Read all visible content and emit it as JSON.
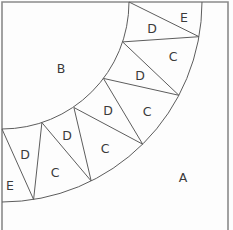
{
  "figure": {
    "figure_type": "quarter-ring-triangulated-template",
    "canvas": {
      "width": 233,
      "height": 230
    },
    "colors": {
      "background": "#fdfdfd",
      "square_border": "#8a8a8a",
      "line": "#5d5d5d",
      "text": "#3a3a3a"
    },
    "square": {
      "left": 2,
      "top": 2,
      "right": 228,
      "bottom_visible": false
    },
    "arcs": [
      {
        "name": "inner-arc",
        "cx": 2,
        "cy": 2,
        "r": 127,
        "from": [
          129,
          2
        ],
        "to": [
          2,
          129
        ]
      },
      {
        "name": "outer-arc",
        "cx": 2,
        "cy": 2,
        "r": 200,
        "from": [
          202,
          2
        ],
        "to": [
          2,
          202
        ]
      }
    ],
    "chords": [
      [
        [
          129,
          2
        ],
        [
          199,
          36.7
        ]
      ],
      [
        [
          122.6,
          41.9
        ],
        [
          199,
          36.7
        ]
      ],
      [
        [
          122.6,
          41.9
        ],
        [
          178.9,
          95.3
        ]
      ],
      [
        [
          103.4,
          78.4
        ],
        [
          178.9,
          95.3
        ]
      ],
      [
        [
          103.4,
          78.4
        ],
        [
          142.7,
          144.2
        ]
      ],
      [
        [
          73.9,
          107.5
        ],
        [
          142.7,
          144.2
        ]
      ],
      [
        [
          73.9,
          107.5
        ],
        [
          91.2,
          181
        ]
      ],
      [
        [
          41.9,
          122.6
        ],
        [
          91.2,
          181
        ]
      ],
      [
        [
          41.9,
          122.6
        ],
        [
          33.6,
          199.5
        ]
      ],
      [
        [
          2,
          129
        ],
        [
          33.6,
          199.5
        ]
      ]
    ],
    "labels": [
      {
        "text": "B",
        "x": 61,
        "y": 68
      },
      {
        "text": "A",
        "x": 183,
        "y": 177
      },
      {
        "text": "E",
        "x": 184,
        "y": 17
      },
      {
        "text": "D",
        "x": 152,
        "y": 28
      },
      {
        "text": "C",
        "x": 173,
        "y": 56
      },
      {
        "text": "D",
        "x": 140,
        "y": 75
      },
      {
        "text": "C",
        "x": 147,
        "y": 111
      },
      {
        "text": "D",
        "x": 108,
        "y": 110
      },
      {
        "text": "C",
        "x": 105,
        "y": 148
      },
      {
        "text": "D",
        "x": 67,
        "y": 135
      },
      {
        "text": "C",
        "x": 55,
        "y": 172
      },
      {
        "text": "D",
        "x": 25,
        "y": 154
      },
      {
        "text": "E",
        "x": 10,
        "y": 185
      }
    ]
  }
}
